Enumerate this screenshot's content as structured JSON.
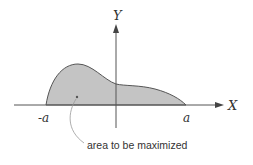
{
  "diagram": {
    "axes": {
      "x_label": "X",
      "y_label": "Y"
    },
    "ticks": {
      "left": "-a",
      "right": "a"
    },
    "annotation": "area to be maximized",
    "colors": {
      "fill": "#c4c4c4",
      "stroke": "#555555",
      "text": "#333333"
    }
  }
}
